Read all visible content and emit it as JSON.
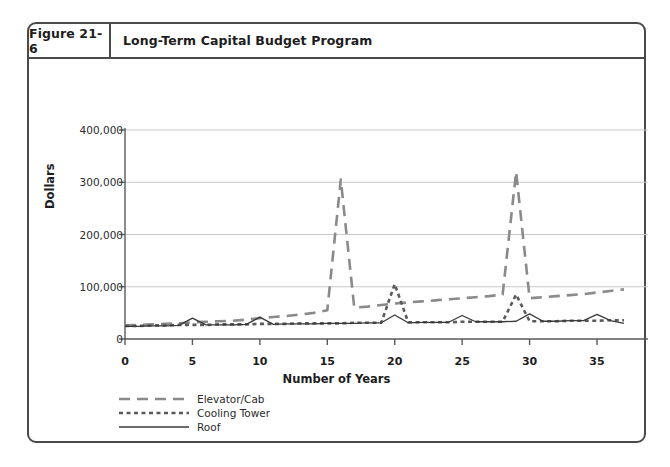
{
  "figure": {
    "number": "Figure 21-6",
    "title": "Long-Term Capital Budget Program"
  },
  "chart_data": {
    "type": "line",
    "title": "Long-Term Capital Budget Program",
    "xlabel": "Number of Years",
    "ylabel": "Dollars",
    "xlim": [
      0,
      37
    ],
    "ylim": [
      0,
      400000
    ],
    "grid": true,
    "legend_position": "below-left",
    "xticks": [
      "0",
      "5",
      "10",
      "15",
      "20",
      "25",
      "30",
      "35"
    ],
    "xtick_values": [
      0,
      5,
      10,
      15,
      20,
      25,
      30,
      35
    ],
    "yticks": [
      "0",
      "100,000",
      "200,000",
      "300,000",
      "400,000"
    ],
    "ytick_values": [
      0,
      100000,
      200000,
      300000,
      400000
    ],
    "x": [
      0,
      1,
      2,
      3,
      4,
      5,
      6,
      7,
      8,
      9,
      10,
      11,
      12,
      13,
      14,
      15,
      16,
      17,
      18,
      19,
      20,
      21,
      22,
      23,
      24,
      25,
      26,
      27,
      28,
      29,
      30,
      31,
      32,
      33,
      34,
      35,
      36,
      37
    ],
    "series": [
      {
        "name": "Elevator/Cab",
        "style": "dashed",
        "color": "#8a8a8a",
        "values": [
          26000,
          27000,
          28000,
          29000,
          30000,
          32000,
          33000,
          34000,
          35000,
          37000,
          40000,
          42000,
          44000,
          47000,
          50000,
          55000,
          305000,
          60000,
          62000,
          65000,
          68000,
          70000,
          72000,
          74000,
          76000,
          78000,
          80000,
          82000,
          85000,
          320000,
          78000,
          80000,
          82000,
          84000,
          86000,
          89000,
          92000,
          95000
        ]
      },
      {
        "name": "Cooling Tower",
        "style": "dotted",
        "color": "#5a5a5a",
        "values": [
          25000,
          25000,
          26000,
          26000,
          27000,
          27000,
          27000,
          28000,
          28000,
          28000,
          29000,
          29000,
          29000,
          30000,
          30000,
          30000,
          30000,
          31000,
          31000,
          31000,
          105000,
          32000,
          32000,
          32000,
          32000,
          33000,
          33000,
          33000,
          33000,
          85000,
          34000,
          34000,
          34000,
          35000,
          35000,
          35000,
          36000,
          36000
        ]
      },
      {
        "name": "Roof",
        "style": "solid",
        "color": "#3a3a3a",
        "values": [
          24000,
          24000,
          25000,
          25000,
          26000,
          40000,
          27000,
          27000,
          27000,
          28000,
          42000,
          28000,
          29000,
          29000,
          29000,
          30000,
          30000,
          30000,
          31000,
          31000,
          46000,
          31000,
          32000,
          32000,
          32000,
          45000,
          33000,
          33000,
          33000,
          34000,
          48000,
          34000,
          34000,
          35000,
          35000,
          47000,
          35000,
          30000
        ]
      }
    ]
  },
  "legend": {
    "items": [
      {
        "label": "Elevator/Cab"
      },
      {
        "label": "Cooling Tower"
      },
      {
        "label": "Roof"
      }
    ]
  },
  "colors": {
    "frame": "#4a4a4a",
    "axis": "#5a5a5a",
    "grid": "#c9c9c9",
    "text": "#1d1d1d"
  }
}
